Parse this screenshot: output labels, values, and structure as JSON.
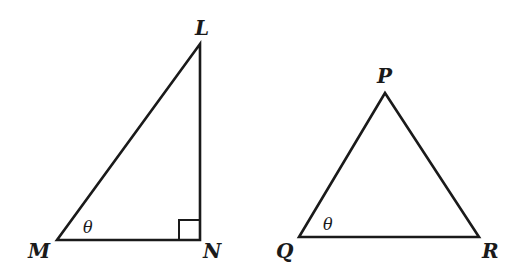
{
  "figure": {
    "type": "geometry-diagram",
    "triangles": [
      {
        "name": "LMN",
        "kind": "right triangle",
        "vertices": {
          "L": {
            "label": "L",
            "x": 200,
            "y": 44
          },
          "M": {
            "label": "M",
            "x": 57,
            "y": 240
          },
          "N": {
            "label": "N",
            "x": 200,
            "y": 240
          }
        },
        "right_angle_at": "N",
        "angle_marks": [
          {
            "at": "M",
            "label": "θ"
          }
        ]
      },
      {
        "name": "PQR",
        "kind": "triangle",
        "vertices": {
          "P": {
            "label": "P",
            "x": 385,
            "y": 93
          },
          "Q": {
            "label": "Q",
            "x": 299,
            "y": 237
          },
          "R": {
            "label": "R",
            "x": 479,
            "y": 237
          }
        },
        "angle_marks": [
          {
            "at": "Q",
            "label": "θ"
          }
        ]
      }
    ]
  },
  "labels": {
    "L": "L",
    "M": "M",
    "N": "N",
    "P": "P",
    "Q": "Q",
    "R": "R",
    "theta_left": "θ",
    "theta_right": "θ"
  },
  "colors": {
    "stroke": "#1a1a1a",
    "background": "#ffffff"
  }
}
